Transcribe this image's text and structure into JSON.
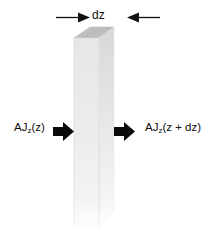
{
  "figure": {
    "background_color": "#ffffff"
  },
  "dimension": {
    "label": "dz",
    "left_arrow_icon": "arrow-right-icon",
    "right_arrow_icon": "arrow-left-icon"
  },
  "flux_in": {
    "prefix": "AJ",
    "subscript": "z",
    "argument": "(z)",
    "full_text": "AJz(z)",
    "arrow_icon": "block-arrow-right-icon"
  },
  "flux_out": {
    "prefix": "AJ",
    "subscript": "z",
    "argument": "(z + dz)",
    "full_text": "AJz(z + dz)",
    "arrow_icon": "block-arrow-right-icon"
  },
  "slab": {
    "name": "volume-element-slab",
    "top_face_color": "#bdbdbd",
    "front_face_color": "#ececec",
    "side_face_color": "#f2f2f2",
    "edge_color": "#d2d2d2"
  }
}
